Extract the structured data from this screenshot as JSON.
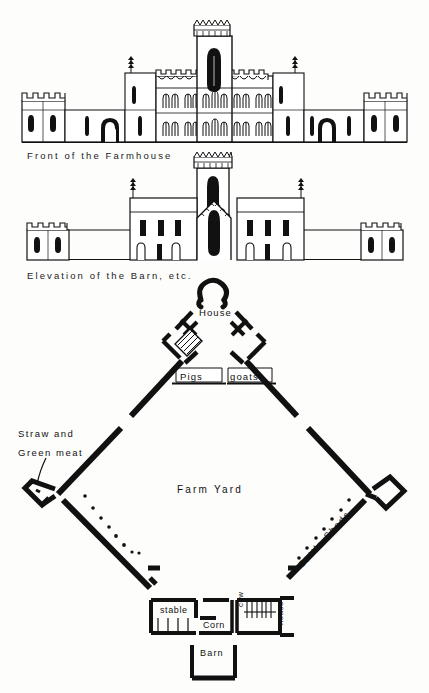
{
  "page": {
    "background_color": "#fdfdfc",
    "ink_color": "#111111"
  },
  "figures": [
    {
      "id": "front-elevation",
      "caption": "Front of the Farmhouse",
      "type": "architectural-elevation"
    },
    {
      "id": "barn-elevation",
      "caption": "Elevation of the Barn, etc.",
      "type": "architectural-elevation"
    },
    {
      "id": "farm-plan",
      "caption": "Farm Yard",
      "type": "site-plan"
    }
  ],
  "captions": {
    "front_elevation": "Front of the Farmhouse",
    "barn_elevation": "Elevation of the Barn, etc."
  },
  "plan_labels": {
    "house": "House",
    "pigs": "Pigs",
    "goats": "goats",
    "straw_line1": "Straw  and",
    "straw_line2": "Green meat",
    "farm_yard": "Farm  Yard",
    "cattle_sheds": "Cattle Sheds",
    "stable": "stable",
    "corn": "Corn",
    "cow": "cow",
    "house_small": "house",
    "barn": "Barn"
  }
}
